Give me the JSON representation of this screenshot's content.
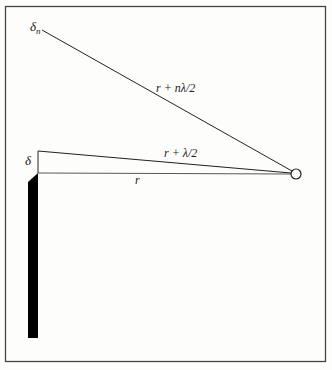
{
  "diagram": {
    "colors": {
      "background": "#fdfdfb",
      "border": "#444444",
      "lines": "#222222",
      "screen": "#000000"
    },
    "labels": {
      "delta_n": "δ",
      "delta_n_sub": "n",
      "delta": "δ",
      "path_long": "r + nλ/2",
      "path_half": "r + λ/2",
      "path_r": "r"
    },
    "points": {
      "observer": {
        "x": 296,
        "y": 174,
        "r": 5
      },
      "delta_n": {
        "x": 42,
        "y": 30
      },
      "delta": {
        "x": 38,
        "y": 151
      },
      "edge": {
        "x": 38,
        "y": 173
      }
    }
  }
}
